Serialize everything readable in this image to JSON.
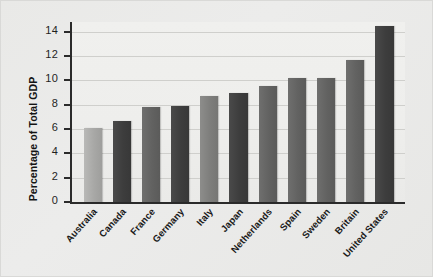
{
  "chart_data": {
    "type": "bar",
    "title": "",
    "xlabel": "",
    "ylabel": "Percentage of Total GDP",
    "ylim": [
      0,
      14.8
    ],
    "yticks": [
      0,
      2,
      4,
      6,
      8,
      10,
      12,
      14
    ],
    "ytick_labels": [
      "0",
      "2",
      "4",
      "6",
      "8",
      "10",
      "12",
      "14"
    ],
    "grid": true,
    "legend": "none",
    "categories": [
      "Australia",
      "Canada",
      "France",
      "Germany",
      "Italy",
      "Japan",
      "Netherlands",
      "Spain",
      "Sweden",
      "Britain",
      "United States"
    ],
    "values": [
      6.1,
      6.7,
      7.8,
      7.9,
      8.7,
      9.0,
      9.5,
      10.2,
      10.2,
      11.7,
      14.5
    ],
    "bar_shades": [
      "light",
      "dark",
      "mid",
      "dark",
      "midlight",
      "dark",
      "mid",
      "mid",
      "mid",
      "mid",
      "dark"
    ],
    "colors": {
      "light": "#b0b0ae",
      "midlight": "#848482",
      "mid": "#656564",
      "dark": "#3d3d3d",
      "axis": "#2b2b2b",
      "grid": "#cfcfcc",
      "plot_background": "#eeeeec",
      "figure_background": "#e9e9e7"
    }
  }
}
